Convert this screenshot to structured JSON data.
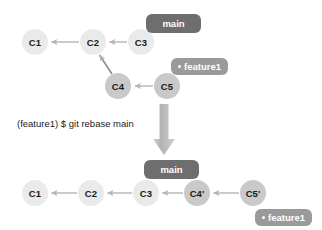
{
  "diagram": {
    "title": "git rebase main",
    "colors": {
      "node_light": "#eaeaea",
      "node_dark": "#c9c9c9",
      "badge_strong": "#6e6e6e",
      "badge_muted": "#9a9a9a",
      "arrow": "#b0b0b0",
      "big_arrow": "#bdbdbd",
      "text": "#1a1a1a",
      "badge_text": "#ffffff",
      "background": "#ffffff"
    }
  },
  "command": {
    "text": "(feature1) $ git rebase main",
    "branch": "feature1",
    "prompt": "$",
    "program": "git rebase main"
  },
  "before": {
    "caption": "before rebase",
    "nodes": [
      {
        "id": "c1",
        "label": "C1",
        "x": 35,
        "y": 42,
        "r": 13,
        "shade": "light"
      },
      {
        "id": "c2",
        "label": "C2",
        "x": 93,
        "y": 42,
        "r": 13,
        "shade": "light"
      },
      {
        "id": "c3",
        "label": "C3",
        "x": 141,
        "y": 42,
        "r": 13,
        "shade": "light"
      },
      {
        "id": "c4",
        "label": "C4",
        "x": 118,
        "y": 86,
        "r": 13,
        "shade": "dark"
      },
      {
        "id": "c5",
        "label": "C5",
        "x": 167,
        "y": 86,
        "r": 13,
        "shade": "dark"
      }
    ],
    "edges": [
      {
        "from": "c2",
        "to": "c1"
      },
      {
        "from": "c3",
        "to": "c2"
      },
      {
        "from": "c4",
        "to": "c2"
      },
      {
        "from": "c5",
        "to": "c4"
      }
    ],
    "badges": [
      {
        "id": "main-top",
        "label": "main",
        "x": 146,
        "y": 14,
        "w": 55,
        "h": 19,
        "style": "strong",
        "current": false
      },
      {
        "id": "feature1-top",
        "label": "feature1",
        "x": 171,
        "y": 58,
        "w": 58,
        "h": 17,
        "style": "muted",
        "current": true
      }
    ]
  },
  "after": {
    "caption": "after rebase",
    "nodes": [
      {
        "id": "c1b",
        "label": "C1",
        "x": 35,
        "y": 193,
        "r": 13,
        "shade": "light"
      },
      {
        "id": "c2b",
        "label": "C2",
        "x": 91,
        "y": 193,
        "r": 13,
        "shade": "light"
      },
      {
        "id": "c3b",
        "label": "C3",
        "x": 146,
        "y": 193,
        "r": 13,
        "shade": "light"
      },
      {
        "id": "c4p",
        "label": "C4'",
        "x": 197,
        "y": 193,
        "r": 13,
        "shade": "dark"
      },
      {
        "id": "c5p",
        "label": "C5'",
        "x": 253,
        "y": 193,
        "r": 13,
        "shade": "dark"
      }
    ],
    "edges": [
      {
        "from": "c2b",
        "to": "c1b"
      },
      {
        "from": "c3b",
        "to": "c2b"
      },
      {
        "from": "c4p",
        "to": "c3b"
      },
      {
        "from": "c5p",
        "to": "c4p"
      }
    ],
    "badges": [
      {
        "id": "main-bottom",
        "label": "main",
        "x": 144,
        "y": 160,
        "w": 55,
        "h": 19,
        "style": "strong",
        "current": false
      },
      {
        "id": "feature1-bottom",
        "label": "feature1",
        "x": 255,
        "y": 209,
        "w": 60,
        "h": 17,
        "style": "muted",
        "current": true
      }
    ]
  },
  "transition_arrow": {
    "direction": "down",
    "x": 155,
    "y": 105,
    "width": 18,
    "height": 50
  }
}
